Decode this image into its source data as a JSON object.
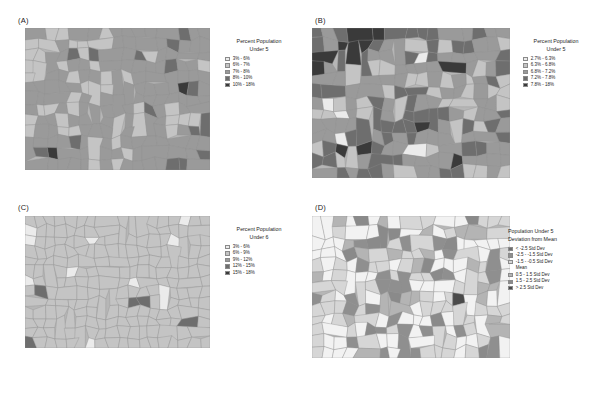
{
  "figure": {
    "width": 590,
    "height": 397,
    "background": "#ffffff"
  },
  "panels": [
    {
      "id": "A",
      "label": "(A)",
      "legend": {
        "title_line1": "Percent Population",
        "title_line2": "Under 5",
        "align": "center",
        "items": [
          {
            "label": "3% - 6%",
            "color": "#ebebeb"
          },
          {
            "label": "6% - 7%",
            "color": "#c4c4c4"
          },
          {
            "label": "7% - 8%",
            "color": "#9a9a9a"
          },
          {
            "label": "8% - 10%",
            "color": "#6e6e6e"
          },
          {
            "label": "10% - 18%",
            "color": "#3a3a3a"
          }
        ]
      },
      "classification": "equal interval",
      "map_tone": "medium"
    },
    {
      "id": "B",
      "label": "(B)",
      "legend": {
        "title_line1": "Percent Population",
        "title_line2": "Under 5",
        "align": "center",
        "items": [
          {
            "label": "2.7% - 6.3%",
            "color": "#ebebeb"
          },
          {
            "label": "6.3% - 6.8%",
            "color": "#c4c4c4"
          },
          {
            "label": "6.8% - 7.2%",
            "color": "#9a9a9a"
          },
          {
            "label": "7.2% - 7.8%",
            "color": "#6e6e6e"
          },
          {
            "label": "7.8% - 18%",
            "color": "#3a3a3a"
          }
        ]
      },
      "classification": "quantile",
      "map_tone": "high-contrast"
    },
    {
      "id": "C",
      "label": "(C)",
      "legend": {
        "title_line1": "Percent Population",
        "title_line2": "Under 6",
        "align": "center",
        "items": [
          {
            "label": "3% - 6%",
            "color": "#ebebeb"
          },
          {
            "label": "6% - 9%",
            "color": "#c4c4c4"
          },
          {
            "label": "9% - 12%",
            "color": "#9a9a9a"
          },
          {
            "label": "12% - 15%",
            "color": "#6e6e6e"
          },
          {
            "label": "15% - 18%",
            "color": "#3a3a3a"
          }
        ]
      },
      "classification": "wide equal interval",
      "map_tone": "uniform"
    },
    {
      "id": "D",
      "label": "(D)",
      "legend": {
        "title_line1": "Population Under 5",
        "title_line2": "Deviation from Mean",
        "align": "left",
        "items": [
          {
            "label": "< -2.5 Std Dev",
            "color": "#6e6e6e"
          },
          {
            "label": "-2.5 - -1.5 Std Dev",
            "color": "#8f8f8f"
          },
          {
            "label": "-1.5 - -0.5 Std Dev",
            "color": "#d6d6d6"
          },
          {
            "label": "Mean",
            "color": "#f2f2f2",
            "no_swatch": true
          },
          {
            "label": "0.5 - 1.5 Std Dev",
            "color": "#b4b4b4"
          },
          {
            "label": "1.5 - 2.5 Std Dev",
            "color": "#8a8a8a"
          },
          {
            "label": "> 2.5 Std Dev",
            "color": "#4a4a4a"
          }
        ]
      },
      "classification": "standard deviation",
      "map_tone": "light"
    }
  ],
  "chart_data": {
    "type": "map",
    "subtype": "choropleth-small-multiples",
    "title": "",
    "panel_count": 4,
    "color_scheme": "grayscale sequential",
    "variable": "Percent Population Under 5",
    "geography": "counties",
    "series": [
      {
        "name": "(A) equal interval",
        "breaks": [
          3,
          6,
          7,
          8,
          10,
          18
        ],
        "units": "%"
      },
      {
        "name": "(B) quantile",
        "breaks": [
          2.7,
          6.3,
          6.8,
          7.2,
          7.8,
          18
        ],
        "units": "%"
      },
      {
        "name": "(C) wide equal interval",
        "breaks": [
          3,
          6,
          9,
          12,
          15,
          18
        ],
        "units": "%"
      },
      {
        "name": "(D) standard deviation",
        "breaks": [
          -2.5,
          -1.5,
          -0.5,
          0.5,
          1.5,
          2.5
        ],
        "units": "std dev"
      }
    ]
  }
}
